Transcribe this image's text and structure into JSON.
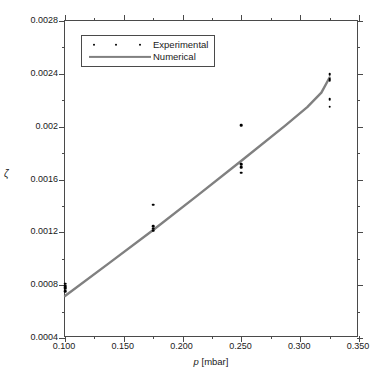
{
  "chart_data": {
    "type": "scatter",
    "title": "",
    "xlabel": "p [mbar]",
    "xlabel_symbol": "p",
    "xlabel_unit": "[mbar]",
    "ylabel": "ζ",
    "xlim": [
      0.1,
      0.35
    ],
    "ylim": [
      0.0004,
      0.0028
    ],
    "grid": false,
    "legend_position": "upper-left",
    "x_ticks": [
      0.1,
      0.15,
      0.2,
      0.25,
      0.3,
      0.35
    ],
    "x_tick_labels": [
      "0.100",
      "0.150",
      "0.200",
      "0.250",
      "0.300",
      "0.350"
    ],
    "x_minor_ticks": [
      0.125,
      0.175,
      0.225,
      0.275,
      0.325
    ],
    "y_ticks": [
      0.0004,
      0.0008,
      0.0012,
      0.0016,
      0.002,
      0.0024,
      0.0028
    ],
    "y_tick_labels": [
      "0.0004",
      "0.0008",
      "0.0012",
      "0.0016",
      "0.002",
      "0.0024",
      "0.0028"
    ],
    "y_minor_ticks": [
      0.0006,
      0.001,
      0.0014,
      0.0018,
      0.0022,
      0.0026
    ],
    "series": [
      {
        "name": "Experimental",
        "type": "scatter",
        "marker": "dot",
        "color": "#000000",
        "points": [
          {
            "x": 0.1,
            "y": 0.00081
          },
          {
            "x": 0.1,
            "y": 0.000795
          },
          {
            "x": 0.1,
            "y": 0.000783
          },
          {
            "x": 0.1,
            "y": 0.000772
          },
          {
            "x": 0.1,
            "y": 0.000755
          },
          {
            "x": 0.175,
            "y": 0.00141
          },
          {
            "x": 0.175,
            "y": 0.001245
          },
          {
            "x": 0.175,
            "y": 0.001228
          },
          {
            "x": 0.175,
            "y": 0.001212
          },
          {
            "x": 0.25,
            "y": 0.002012
          },
          {
            "x": 0.25,
            "y": 0.001715
          },
          {
            "x": 0.25,
            "y": 0.001692
          },
          {
            "x": 0.25,
            "y": 0.00165
          },
          {
            "x": 0.325,
            "y": 0.002395
          },
          {
            "x": 0.325,
            "y": 0.002362
          },
          {
            "x": 0.325,
            "y": 0.002352
          },
          {
            "x": 0.325,
            "y": 0.002208
          },
          {
            "x": 0.325,
            "y": 0.002152
          }
        ]
      },
      {
        "name": "Numerical",
        "type": "line",
        "color": "#808080",
        "points": [
          {
            "x": 0.1,
            "y": 0.000718
          },
          {
            "x": 0.1375,
            "y": 0.000967
          },
          {
            "x": 0.175,
            "y": 0.001218
          },
          {
            "x": 0.2125,
            "y": 0.001478
          },
          {
            "x": 0.25,
            "y": 0.001742
          },
          {
            "x": 0.2875,
            "y": 0.00201
          },
          {
            "x": 0.306,
            "y": 0.002148
          },
          {
            "x": 0.318,
            "y": 0.002258
          },
          {
            "x": 0.325,
            "y": 0.002372
          }
        ]
      }
    ]
  },
  "legend": {
    "entries": [
      {
        "label": "Experimental",
        "key": "dots"
      },
      {
        "label": "Numerical",
        "key": "line"
      }
    ]
  }
}
